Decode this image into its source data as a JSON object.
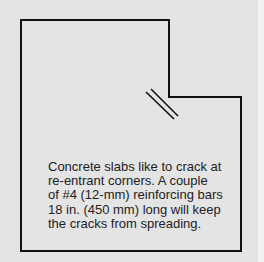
{
  "diagram": {
    "colors": {
      "background": "#e4e4e4",
      "outline": "#111111",
      "text": "#222222"
    },
    "slab_outline_points": [
      [
        21,
        20
      ],
      [
        169,
        20
      ],
      [
        169,
        97
      ],
      [
        241,
        97
      ],
      [
        241,
        251
      ],
      [
        21,
        251
      ]
    ],
    "rebar_marks": [
      {
        "x1": 146,
        "y1": 92,
        "x2": 174,
        "y2": 119
      },
      {
        "x1": 151,
        "y1": 89,
        "x2": 178,
        "y2": 116
      }
    ],
    "caption_lines": [
      "Concrete slabs like to crack at",
      "re-entrant corners.  A couple",
      "of #4 (12-mm) reinforcing bars",
      "18 in. (450 mm) long will keep",
      "the cracks from spreading."
    ]
  }
}
